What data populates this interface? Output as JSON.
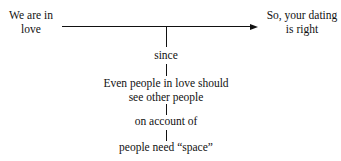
{
  "diagram": {
    "type": "argument-structure",
    "claim": "We are in love",
    "claim_lines": [
      "We are in",
      "love"
    ],
    "conclusion_lines": [
      "So, your dating",
      "is right"
    ],
    "warrant_connector": "since",
    "warrant_lines": [
      "Even people in love should",
      "see other people"
    ],
    "backing_connector": "on account of",
    "backing": "people need “space”"
  }
}
